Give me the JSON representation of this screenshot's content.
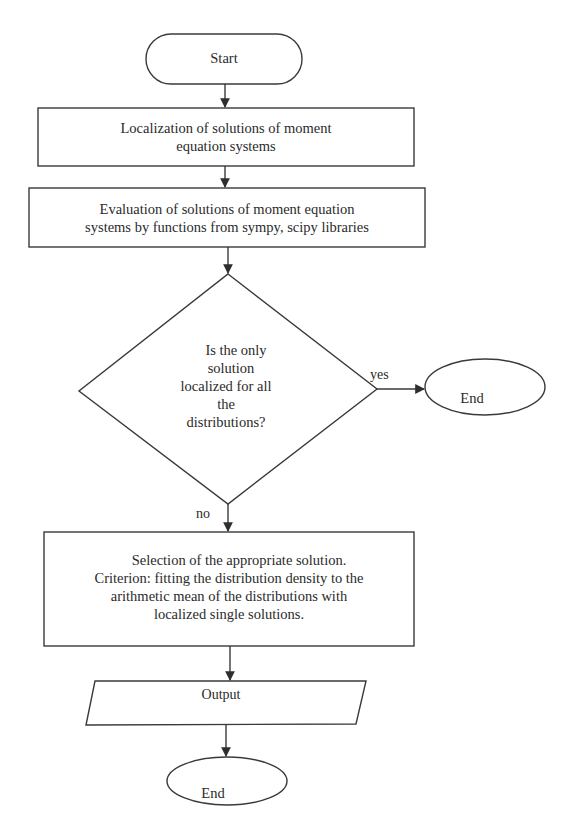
{
  "diagram": {
    "type": "flowchart",
    "stroke_color": "#3a3a3a",
    "nodes": {
      "start": {
        "shape": "terminator",
        "label": "Start"
      },
      "localization": {
        "shape": "process",
        "label": "Localization of solutions of moment equation systems"
      },
      "evaluation": {
        "shape": "process",
        "label": "Evaluation of solutions of moment equation systems by functions from sympy, scipy libraries"
      },
      "decision": {
        "shape": "decision",
        "label": "Is the only solution localized for all the distributions?"
      },
      "end_yes": {
        "shape": "terminator-ellipse",
        "label": "End"
      },
      "selection": {
        "shape": "process",
        "label": "Selection of the appropriate solution. Criterion: fitting the distribution density to the arithmetic mean of the distributions with localized single solutions."
      },
      "output": {
        "shape": "input-output",
        "label": "Output"
      },
      "end_final": {
        "shape": "terminator-ellipse",
        "label": "End"
      }
    },
    "edges": [
      {
        "from": "start",
        "to": "localization",
        "label": ""
      },
      {
        "from": "localization",
        "to": "evaluation",
        "label": ""
      },
      {
        "from": "evaluation",
        "to": "decision",
        "label": ""
      },
      {
        "from": "decision",
        "to": "end_yes",
        "label": "yes"
      },
      {
        "from": "decision",
        "to": "selection",
        "label": "no"
      },
      {
        "from": "selection",
        "to": "output",
        "label": ""
      },
      {
        "from": "output",
        "to": "end_final",
        "label": ""
      }
    ],
    "text_lines": {
      "localization": [
        "Localization of solutions of moment",
        "equation systems"
      ],
      "evaluation": [
        "Evaluation of solutions of moment equation",
        "systems by functions from sympy, scipy libraries"
      ],
      "decision": [
        "Is the only",
        "solution",
        "localized for all",
        "the",
        "distributions?"
      ],
      "selection": [
        "Selection of the appropriate solution.",
        "Criterion: fitting the distribution density to the",
        "arithmetic mean of the distributions with",
        "localized single solutions."
      ]
    },
    "edge_labels": {
      "yes": "yes",
      "no": "no"
    }
  }
}
